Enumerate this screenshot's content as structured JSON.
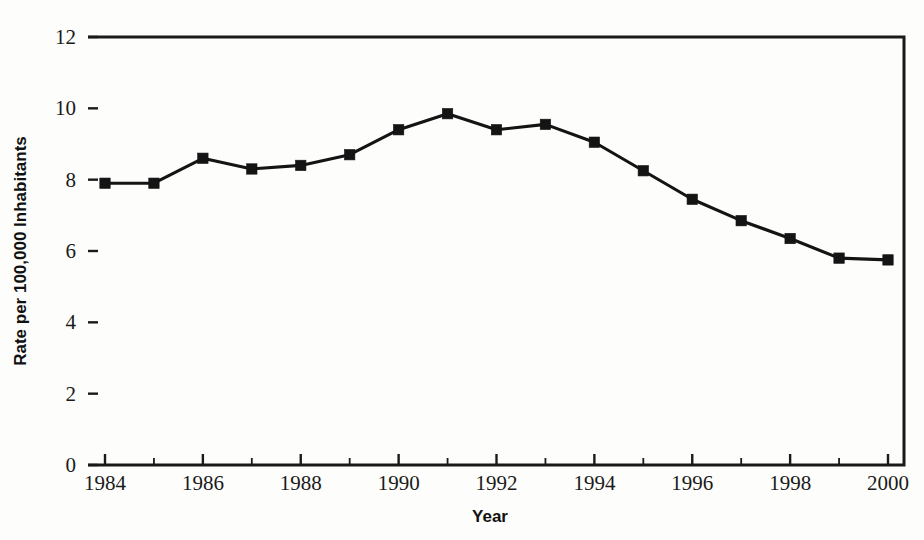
{
  "chart_data": {
    "type": "line",
    "title": "",
    "subtitle": "",
    "xlabel": "Year",
    "ylabel": "Rate per 100,000 Inhabitants",
    "x": [
      1984,
      1985,
      1986,
      1987,
      1988,
      1989,
      1990,
      1991,
      1992,
      1993,
      1994,
      1995,
      1996,
      1997,
      1998,
      1999,
      2000
    ],
    "values": [
      7.9,
      7.9,
      8.6,
      8.3,
      8.4,
      8.7,
      9.4,
      9.85,
      9.4,
      9.55,
      9.05,
      8.25,
      7.45,
      6.85,
      6.35,
      5.8,
      5.75
    ],
    "series": [
      {
        "name": "Rate",
        "values": [
          7.9,
          7.9,
          8.6,
          8.3,
          8.4,
          8.7,
          9.4,
          9.85,
          9.4,
          9.55,
          9.05,
          8.25,
          7.45,
          6.85,
          6.35,
          5.8,
          5.75
        ],
        "color": "#141414",
        "marker": "square"
      }
    ],
    "xlim": [
      1984,
      2000
    ],
    "ylim": [
      0,
      12
    ],
    "y_ticks": [
      0,
      2,
      4,
      6,
      8,
      10,
      12
    ],
    "y_tick_labels": [
      "0",
      "2",
      "4",
      "6",
      "8",
      "10",
      "12"
    ],
    "x_ticks": [
      1984,
      1986,
      1988,
      1990,
      1992,
      1994,
      1996,
      1998,
      2000
    ],
    "x_tick_labels": [
      "1984",
      "1986",
      "1988",
      "1990",
      "1992",
      "1994",
      "1996",
      "1998",
      "2000"
    ],
    "x_minor_ticks": [
      1985,
      1987,
      1989,
      1991,
      1993,
      1995,
      1997,
      1999
    ],
    "grid": false,
    "legend": false,
    "legend_position": "none",
    "annotations": []
  },
  "axes": {
    "x_title": "Year",
    "y_title": "Rate per 100,000 Inhabitants"
  },
  "colors": {
    "line": "#141414",
    "axis": "#1a1a1a",
    "background": "#fdfdfb",
    "text": "#1a1a1a"
  }
}
